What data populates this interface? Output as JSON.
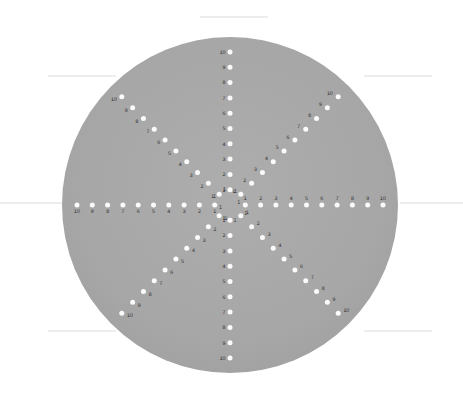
{
  "figure": {
    "background_color": "#ffffff",
    "disc_color": "#a8a8a8",
    "disc_edge_color": "#9d9d9d",
    "dot_color": "#fbfbfb",
    "label_color": "#2b2b2b",
    "guide_line_color": "#dcdcdc"
  },
  "disc": {
    "center_x": 230,
    "center_y": 205,
    "radius": 168
  },
  "scale": {
    "min": 1,
    "max": 10,
    "tick_count": 10,
    "pixels_per_unit": 15.3,
    "center_ring_value": 1,
    "center_ring_radius_px": 15.3
  },
  "chart_data": {
    "type": "scatter",
    "xlabel": "",
    "ylabel": "",
    "grid": false,
    "legend": null,
    "axis_count": 8,
    "axis_angles_deg": [
      0,
      45,
      90,
      135,
      180,
      225,
      270,
      315
    ],
    "tick_values": [
      1,
      2,
      3,
      4,
      5,
      6,
      7,
      8,
      9,
      10
    ],
    "series": [
      {
        "name": "east-arm",
        "angle_deg": 0,
        "values": [
          1,
          2,
          3,
          4,
          5,
          6,
          7,
          8,
          9,
          10
        ]
      },
      {
        "name": "northeast-arm",
        "angle_deg": 45,
        "values": [
          1,
          2,
          3,
          4,
          5,
          6,
          7,
          8,
          9,
          10
        ]
      },
      {
        "name": "north-arm",
        "angle_deg": 90,
        "values": [
          1,
          2,
          3,
          4,
          5,
          6,
          7,
          8,
          9,
          10
        ]
      },
      {
        "name": "northwest-arm",
        "angle_deg": 135,
        "values": [
          1,
          2,
          3,
          4,
          5,
          6,
          7,
          8,
          9,
          10
        ]
      },
      {
        "name": "west-arm",
        "angle_deg": 180,
        "values": [
          1,
          2,
          3,
          4,
          5,
          6,
          7,
          8,
          9,
          10
        ]
      },
      {
        "name": "southwest-arm",
        "angle_deg": 225,
        "values": [
          1,
          2,
          3,
          4,
          5,
          6,
          7,
          8,
          9,
          10
        ]
      },
      {
        "name": "south-arm",
        "angle_deg": 270,
        "values": [
          1,
          2,
          3,
          4,
          5,
          6,
          7,
          8,
          9,
          10
        ]
      },
      {
        "name": "southeast-arm",
        "angle_deg": 315,
        "values": [
          1,
          2,
          3,
          4,
          5,
          6,
          7,
          8,
          9,
          10
        ]
      }
    ]
  },
  "arms": [
    {
      "name": "east-arm",
      "angle_deg": 0,
      "label_dx": 0,
      "label_dy": -5.5,
      "anchor": "middle",
      "ticks": [
        {
          "value": 1,
          "label": "1"
        },
        {
          "value": 2,
          "label": "2"
        },
        {
          "value": 3,
          "label": "3"
        },
        {
          "value": 4,
          "label": "4"
        },
        {
          "value": 5,
          "label": "5"
        },
        {
          "value": 6,
          "label": "6"
        },
        {
          "value": 7,
          "label": "7"
        },
        {
          "value": 8,
          "label": "8"
        },
        {
          "value": 9,
          "label": "9"
        },
        {
          "value": 10,
          "label": "10"
        }
      ]
    },
    {
      "name": "northeast-arm",
      "angle_deg": 45,
      "label_dx": -5.5,
      "label_dy": -1.5,
      "anchor": "end",
      "ticks": [
        {
          "value": 1,
          "label": "1"
        },
        {
          "value": 2,
          "label": "2"
        },
        {
          "value": 3,
          "label": "3"
        },
        {
          "value": 4,
          "label": "4"
        },
        {
          "value": 5,
          "label": "5"
        },
        {
          "value": 6,
          "label": "6"
        },
        {
          "value": 7,
          "label": "7"
        },
        {
          "value": 8,
          "label": "8"
        },
        {
          "value": 9,
          "label": "9"
        },
        {
          "value": 10,
          "label": "10"
        }
      ]
    },
    {
      "name": "north-arm",
      "angle_deg": 90,
      "label_dx": -4.5,
      "label_dy": 1.8,
      "anchor": "end",
      "ticks": [
        {
          "value": 1,
          "label": "1"
        },
        {
          "value": 2,
          "label": "2"
        },
        {
          "value": 3,
          "label": "3"
        },
        {
          "value": 4,
          "label": "4"
        },
        {
          "value": 5,
          "label": "5"
        },
        {
          "value": 6,
          "label": "6"
        },
        {
          "value": 7,
          "label": "7"
        },
        {
          "value": 8,
          "label": "8"
        },
        {
          "value": 9,
          "label": "9"
        },
        {
          "value": 10,
          "label": "10"
        }
      ]
    },
    {
      "name": "northwest-arm",
      "angle_deg": 135,
      "label_dx": -5.0,
      "label_dy": 4.2,
      "anchor": "end",
      "ticks": [
        {
          "value": 1,
          "label": "1"
        },
        {
          "value": 2,
          "label": "2"
        },
        {
          "value": 3,
          "label": "3"
        },
        {
          "value": 4,
          "label": "4"
        },
        {
          "value": 5,
          "label": "5"
        },
        {
          "value": 6,
          "label": "6"
        },
        {
          "value": 7,
          "label": "7"
        },
        {
          "value": 8,
          "label": "8"
        },
        {
          "value": 9,
          "label": "9"
        },
        {
          "value": 10,
          "label": "10"
        }
      ]
    },
    {
      "name": "west-arm",
      "angle_deg": 180,
      "label_dx": 0,
      "label_dy": 8.0,
      "anchor": "middle",
      "ticks": [
        {
          "value": 1,
          "label": "1"
        },
        {
          "value": 2,
          "label": "2"
        },
        {
          "value": 3,
          "label": "3"
        },
        {
          "value": 4,
          "label": "4"
        },
        {
          "value": 5,
          "label": "5"
        },
        {
          "value": 6,
          "label": "6"
        },
        {
          "value": 7,
          "label": "7"
        },
        {
          "value": 8,
          "label": "8"
        },
        {
          "value": 9,
          "label": "9"
        },
        {
          "value": 10,
          "label": "10"
        }
      ]
    },
    {
      "name": "southwest-arm",
      "angle_deg": 225,
      "label_dx": 5.2,
      "label_dy": 4.2,
      "anchor": "start",
      "ticks": [
        {
          "value": 1,
          "label": "1"
        },
        {
          "value": 2,
          "label": "2"
        },
        {
          "value": 3,
          "label": "3"
        },
        {
          "value": 4,
          "label": "4"
        },
        {
          "value": 5,
          "label": "5"
        },
        {
          "value": 6,
          "label": "6"
        },
        {
          "value": 7,
          "label": "7"
        },
        {
          "value": 8,
          "label": "8"
        },
        {
          "value": 9,
          "label": "9"
        },
        {
          "value": 10,
          "label": "10"
        }
      ]
    },
    {
      "name": "south-arm",
      "angle_deg": 270,
      "label_dx": -4.5,
      "label_dy": 1.8,
      "anchor": "end",
      "ticks": [
        {
          "value": 1,
          "label": "1"
        },
        {
          "value": 2,
          "label": "2"
        },
        {
          "value": 3,
          "label": "3"
        },
        {
          "value": 4,
          "label": "4"
        },
        {
          "value": 5,
          "label": "5"
        },
        {
          "value": 6,
          "label": "6"
        },
        {
          "value": 7,
          "label": "7"
        },
        {
          "value": 8,
          "label": "8"
        },
        {
          "value": 9,
          "label": "9"
        },
        {
          "value": 10,
          "label": "10"
        }
      ]
    },
    {
      "name": "southeast-arm",
      "angle_deg": 315,
      "label_dx": 5.2,
      "label_dy": -1.5,
      "anchor": "start",
      "ticks": [
        {
          "value": 1,
          "label": "1"
        },
        {
          "value": 2,
          "label": "2"
        },
        {
          "value": 3,
          "label": "3"
        },
        {
          "value": 4,
          "label": "4"
        },
        {
          "value": 5,
          "label": "5"
        },
        {
          "value": 6,
          "label": "6"
        },
        {
          "value": 7,
          "label": "7"
        },
        {
          "value": 8,
          "label": "8"
        },
        {
          "value": 9,
          "label": "9"
        },
        {
          "value": 10,
          "label": "10"
        }
      ]
    }
  ],
  "guide_lines": [
    {
      "name": "guide-top",
      "x1": 200,
      "y1": 17,
      "x2": 268,
      "y2": 17
    },
    {
      "name": "guide-upper-left",
      "x1": 48,
      "y1": 76,
      "x2": 116,
      "y2": 76
    },
    {
      "name": "guide-upper-right",
      "x1": 364,
      "y1": 76,
      "x2": 432,
      "y2": 76
    },
    {
      "name": "guide-mid-left",
      "x1": 0,
      "y1": 203,
      "x2": 62,
      "y2": 203
    },
    {
      "name": "guide-mid-right",
      "x1": 400,
      "y1": 203,
      "x2": 463,
      "y2": 203
    },
    {
      "name": "guide-lower-left",
      "x1": 48,
      "y1": 331,
      "x2": 116,
      "y2": 331
    },
    {
      "name": "guide-lower-right",
      "x1": 364,
      "y1": 331,
      "x2": 432,
      "y2": 331
    }
  ]
}
